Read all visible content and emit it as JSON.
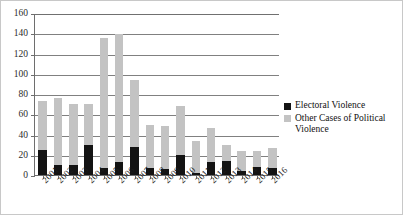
{
  "chart_data": {
    "type": "bar",
    "stacked": true,
    "title": "",
    "xlabel": "",
    "ylabel": "",
    "ylim": [
      0,
      160
    ],
    "ytick_step": 20,
    "yticks": [
      0,
      20,
      40,
      60,
      80,
      100,
      120,
      140,
      160
    ],
    "grid": true,
    "legend_position": "right",
    "categories": [
      "2001",
      "2002",
      "2003",
      "2004",
      "2005",
      "2006",
      "2007",
      "2008",
      "2009",
      "2010",
      "2011",
      "2012",
      "2013",
      "2014",
      "2015",
      "2016"
    ],
    "series": [
      {
        "name": "Electoral Violence",
        "color": "#131313",
        "values": [
          25,
          10,
          10,
          30,
          7,
          13,
          28,
          7,
          6,
          20,
          2,
          13,
          14,
          4,
          8,
          7
        ]
      },
      {
        "name": "Other Cases of Political Violence",
        "color": "#c3c3c3",
        "values": [
          48,
          66,
          60,
          40,
          128,
          126,
          66,
          42,
          42,
          48,
          32,
          33,
          16,
          20,
          16,
          20
        ]
      }
    ],
    "totals": [
      73,
      76,
      70,
      70,
      135,
      139,
      94,
      49,
      48,
      68,
      34,
      46,
      30,
      24,
      24,
      27
    ]
  },
  "legend": {
    "items": [
      {
        "label": "Electoral Violence",
        "color": "#131313"
      },
      {
        "label": "Other Cases of Political Violence",
        "color": "#c3c3c3"
      }
    ]
  }
}
